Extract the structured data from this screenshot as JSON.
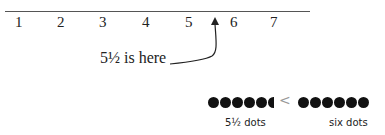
{
  "number_line": {
    "ticks": [
      "1",
      "2",
      "3",
      "4",
      "5",
      "6",
      "7"
    ]
  },
  "callout": {
    "label": "5½ is here",
    "points_to": 5.5
  },
  "comparison": {
    "left_label": "5½ dots",
    "left_count": 5.5,
    "operator": "<",
    "right_label": "six dots",
    "right_count": 6
  }
}
